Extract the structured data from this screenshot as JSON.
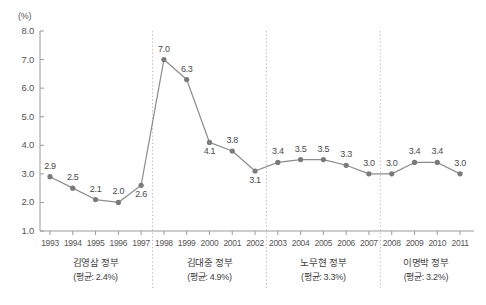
{
  "chart_data": {
    "type": "line",
    "title": "",
    "subtitle": "",
    "xlabel": "",
    "ylabel": "(%)",
    "unit_label": "(%)",
    "grid": false,
    "legend": "none",
    "ylim": [
      1.0,
      8.0
    ],
    "ytick_labels": [
      "8.0",
      "7.0",
      "6.0",
      "5.0",
      "4.0",
      "3.0",
      "2.0",
      "1.0"
    ],
    "ytick_values": [
      8.0,
      7.0,
      6.0,
      5.0,
      4.0,
      3.0,
      2.0,
      1.0
    ],
    "categories": [
      "1993",
      "1994",
      "1995",
      "1996",
      "1997",
      "1998",
      "1999",
      "2000",
      "2001",
      "2002",
      "2003",
      "2004",
      "2005",
      "2006",
      "2007",
      "2008",
      "2009",
      "2010",
      "2011"
    ],
    "values": [
      2.9,
      2.5,
      2.1,
      2.0,
      2.6,
      7.0,
      6.3,
      4.1,
      3.8,
      3.1,
      3.4,
      3.5,
      3.5,
      3.3,
      3.0,
      3.0,
      3.4,
      3.4,
      3.0
    ],
    "point_labels": [
      "2.9",
      "2.5",
      "2.1",
      "2.0",
      "2.6",
      "7.0",
      "6.3",
      "4.1",
      "3.8",
      "3.1",
      "3.4",
      "3.5",
      "3.5",
      "3.3",
      "3.0",
      "3.0",
      "3.4",
      "3.4",
      "3.0"
    ],
    "label_positions": [
      "above",
      "above",
      "above",
      "above",
      "below",
      "above",
      "above",
      "below",
      "above",
      "below",
      "above",
      "above",
      "above",
      "above",
      "above",
      "above",
      "above",
      "above",
      "above"
    ],
    "series": [
      {
        "name": "",
        "values": [
          2.9,
          2.5,
          2.1,
          2.0,
          2.6,
          7.0,
          6.3,
          4.1,
          3.8,
          3.1,
          3.4,
          3.5,
          3.5,
          3.3,
          3.0,
          3.0,
          3.4,
          3.4,
          3.0
        ]
      }
    ],
    "dividers_after": [
      "1997",
      "2002",
      "2007"
    ],
    "eras": [
      {
        "name": "김영삼 정부",
        "avg": "(평균: 2.4%)",
        "start": "1993",
        "end": "1997"
      },
      {
        "name": "김대중 정부",
        "avg": "(평균: 4.9%)",
        "start": "1998",
        "end": "2002"
      },
      {
        "name": "노무현 정부",
        "avg": "(평균: 3.3%)",
        "start": "2003",
        "end": "2007"
      },
      {
        "name": "이명박 정부",
        "avg": "(평균: 3.2%)",
        "start": "2008",
        "end": "2011"
      }
    ]
  },
  "colors": {
    "line": "#8c8c8c",
    "marker": "#7a7a7a",
    "axis": "#9a9a9a",
    "divider": "#bdbdbd",
    "text": "#4a4a4a"
  }
}
